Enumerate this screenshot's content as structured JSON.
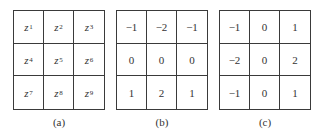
{
  "figure": {
    "panels": [
      {
        "caption": "(a)",
        "kind": "variables",
        "cells": [
          [
            {
              "var": "z",
              "sub": "1"
            },
            {
              "var": "z",
              "sub": "2"
            },
            {
              "var": "z",
              "sub": "3"
            }
          ],
          [
            {
              "var": "z",
              "sub": "4"
            },
            {
              "var": "z",
              "sub": "5"
            },
            {
              "var": "z",
              "sub": "6"
            }
          ],
          [
            {
              "var": "z",
              "sub": "7"
            },
            {
              "var": "z",
              "sub": "8"
            },
            {
              "var": "z",
              "sub": "9"
            }
          ]
        ]
      },
      {
        "caption": "(b)",
        "kind": "values",
        "cells": [
          [
            "−1",
            "−2",
            "−1"
          ],
          [
            "0",
            "0",
            "0"
          ],
          [
            "1",
            "2",
            "1"
          ]
        ]
      },
      {
        "caption": "(c)",
        "kind": "values",
        "cells": [
          [
            "−1",
            "0",
            "1"
          ],
          [
            "−2",
            "0",
            "2"
          ],
          [
            "−1",
            "0",
            "1"
          ]
        ]
      }
    ]
  }
}
